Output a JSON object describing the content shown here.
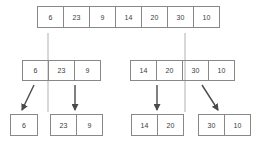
{
  "diagram": {
    "colors": {
      "cell_border": "#888888",
      "text": "#3b3b3b",
      "divider": "#b0b0b0",
      "arrow": "#4a4a4a",
      "background": "#ffffff"
    },
    "levels": [
      {
        "name": "level-0",
        "arrays": [
          {
            "name": "array-top",
            "values": [
              "6",
              "23",
              "9",
              "14",
              "20",
              "30",
              "10"
            ]
          }
        ]
      },
      {
        "name": "level-1",
        "arrays": [
          {
            "name": "array-mid-left",
            "values": [
              "6",
              "23",
              "9"
            ]
          },
          {
            "name": "array-mid-right",
            "values": [
              "14",
              "20",
              "30",
              "10"
            ]
          }
        ]
      },
      {
        "name": "level-2",
        "arrays": [
          {
            "name": "array-bot-1",
            "values": [
              "6"
            ]
          },
          {
            "name": "array-bot-2",
            "values": [
              "23",
              "9"
            ]
          },
          {
            "name": "array-bot-3",
            "values": [
              "14",
              "20"
            ]
          },
          {
            "name": "array-bot-4",
            "values": [
              "30",
              "10"
            ]
          }
        ]
      }
    ],
    "dividers": [
      {
        "name": "divider-left",
        "x": 48,
        "y1": 33,
        "y2": 112
      },
      {
        "name": "divider-right",
        "x": 185,
        "y1": 33,
        "y2": 112
      }
    ],
    "arrows": [
      {
        "name": "arrow-to-bot-1",
        "x1": 34,
        "y1": 85,
        "x2": 21,
        "y2": 111
      },
      {
        "name": "arrow-to-bot-2",
        "x1": 75,
        "y1": 85,
        "x2": 75,
        "y2": 111
      },
      {
        "name": "arrow-to-bot-3",
        "x1": 157,
        "y1": 85,
        "x2": 157,
        "y2": 111
      },
      {
        "name": "arrow-to-bot-4",
        "x1": 202,
        "y1": 85,
        "x2": 219,
        "y2": 111
      }
    ]
  }
}
